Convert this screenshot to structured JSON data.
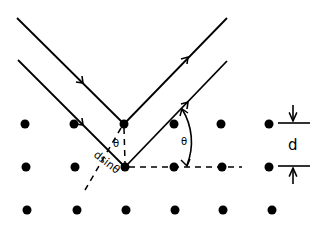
{
  "diagram": {
    "colors": {
      "ink": "#000000",
      "background": "#ffffff"
    },
    "lattice": {
      "rows": [
        {
          "y": 124,
          "xs": [
            25,
            74,
            124,
            174,
            221,
            269
          ]
        },
        {
          "y": 167,
          "xs": [
            26,
            75,
            125,
            174,
            222,
            269
          ]
        },
        {
          "y": 210,
          "xs": [
            27,
            77,
            126,
            175,
            223,
            272
          ]
        }
      ],
      "dot_radius": 4.5
    },
    "rays": {
      "incident": [
        {
          "from": [
            17,
            18
          ],
          "to": [
            124,
            124
          ],
          "arrow_at": [
            82,
            82
          ]
        },
        {
          "from": [
            18,
            60
          ],
          "to": [
            125,
            167
          ],
          "arrow_at": [
            82,
            124
          ]
        }
      ],
      "reflected": [
        {
          "from": [
            124,
            124
          ],
          "to": [
            227,
            18
          ],
          "arrow_at": [
            187,
            58
          ]
        },
        {
          "from": [
            125,
            167
          ],
          "to": [
            227,
            61
          ],
          "arrow_at": [
            187,
            103
          ]
        }
      ]
    },
    "labels": {
      "theta_inner": "θ",
      "theta_arc": "θ",
      "path_difference": "dsinθ",
      "spacing": "d"
    }
  }
}
